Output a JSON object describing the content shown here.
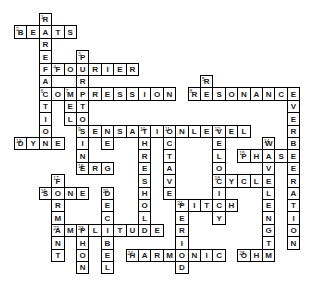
{
  "puzzle": {
    "type": "crossword",
    "title": "",
    "grid": {
      "cell_size": 19,
      "origin_x": 14,
      "origin_y": 14,
      "columns": 16,
      "rows": 15
    },
    "entries": [
      {
        "number": 1,
        "direction": "down",
        "answer": "RAREFACTION",
        "col": 2,
        "row": 0
      },
      {
        "number": 2,
        "direction": "across",
        "answer": "BEATS",
        "col": 0,
        "row": 1
      },
      {
        "number": 3,
        "direction": "down",
        "answer": "PURETONE",
        "col": 5,
        "row": 2
      },
      {
        "number": 4,
        "direction": "across",
        "answer": "FOURIER",
        "col": 3,
        "row": 3
      },
      {
        "number": 5,
        "direction": "down",
        "answer": "REVERBERATION",
        "col": 15,
        "row": 4
      },
      {
        "number": 6,
        "direction": "across",
        "answer": "COMPRESSION",
        "col": 2,
        "row": 5
      },
      {
        "number": 7,
        "direction": "down",
        "answer": "MEL",
        "col": 3,
        "row": 5
      },
      {
        "number": 8,
        "direction": "across",
        "answer": "RESONANCE",
        "col": 10,
        "row": 5
      },
      {
        "number": 9,
        "direction": "down",
        "answer": "SINE",
        "col": 4,
        "row": 8
      },
      {
        "number": 9,
        "direction": "across",
        "answer": "SENSATIONLEVEL",
        "col": 4,
        "row": 8
      },
      {
        "number": 10,
        "direction": "down",
        "answer": "THRESHOLD",
        "col": 7,
        "row": 8
      },
      {
        "number": 11,
        "direction": "down",
        "answer": "OCTAVE",
        "col": 9,
        "row": 8
      },
      {
        "number": 12,
        "direction": "down",
        "answer": "VELOCITY",
        "col": 11,
        "row": 8
      },
      {
        "number": 13,
        "direction": "across",
        "answer": "DYNE",
        "col": 0,
        "row": 9
      },
      {
        "number": 14,
        "direction": "down",
        "answer": "WAVELENGTH",
        "col": 13,
        "row": 9
      },
      {
        "number": 15,
        "direction": "across",
        "answer": "PHASE",
        "col": 12,
        "row": 10
      },
      {
        "number": 16,
        "direction": "across",
        "answer": "ERG",
        "col": 4,
        "row": 11
      },
      {
        "number": 17,
        "direction": "down",
        "answer": "FORMANT",
        "col": 2,
        "row": 12
      },
      {
        "number": 18,
        "direction": "across",
        "answer": "CYCLE",
        "col": 11,
        "row": 12
      },
      {
        "number": 19,
        "direction": "across",
        "answer": "SONE",
        "col": 1,
        "row": 13
      },
      {
        "number": 20,
        "direction": "down",
        "answer": "DECIBEL",
        "col": 5,
        "row": 13
      },
      {
        "number": 21,
        "direction": "down",
        "answer": "PERIOD",
        "col": 9,
        "row": 14
      },
      {
        "number": 21,
        "direction": "across",
        "answer": "PITCH",
        "col": 9,
        "row": 14
      },
      {
        "number": 22,
        "direction": "down",
        "answer": "PHON",
        "col": 4,
        "row": 16
      },
      {
        "number": 23,
        "direction": "across",
        "answer": "AMPLITUDE",
        "col": 2,
        "row": 16
      },
      {
        "number": 24,
        "direction": "across",
        "answer": "HARMONIC",
        "col": 6,
        "row": 18
      },
      {
        "number": 25,
        "direction": "across",
        "answer": "OHM",
        "col": 13,
        "row": 18
      }
    ],
    "cells": [
      {
        "c": 2,
        "r": 0,
        "l": "R",
        "n": "1"
      },
      {
        "c": 0,
        "r": 1,
        "l": "B",
        "n": "2"
      },
      {
        "c": 1,
        "r": 1,
        "l": "E",
        "n": ""
      },
      {
        "c": 2,
        "r": 1,
        "l": "A",
        "n": ""
      },
      {
        "c": 3,
        "r": 1,
        "l": "T",
        "n": ""
      },
      {
        "c": 4,
        "r": 1,
        "l": "S",
        "n": ""
      },
      {
        "c": 2,
        "r": 2,
        "l": "R",
        "n": ""
      },
      {
        "c": 2,
        "r": 3,
        "l": "E",
        "n": ""
      },
      {
        "c": 5,
        "r": 3,
        "l": "P",
        "n": "3"
      },
      {
        "c": 2,
        "r": 4,
        "l": "F",
        "n": ""
      },
      {
        "c": 3,
        "r": 4,
        "l": "F",
        "n": "4"
      },
      {
        "c": 4,
        "r": 4,
        "l": "O",
        "n": ""
      },
      {
        "c": 5,
        "r": 4,
        "l": "U",
        "n": ""
      },
      {
        "c": 6,
        "r": 4,
        "l": "R",
        "n": ""
      },
      {
        "c": 7,
        "r": 4,
        "l": "I",
        "n": ""
      },
      {
        "c": 8,
        "r": 4,
        "l": "E",
        "n": ""
      },
      {
        "c": 9,
        "r": 4,
        "l": "R",
        "n": ""
      },
      {
        "c": 2,
        "r": 5,
        "l": "A",
        "n": ""
      },
      {
        "c": 5,
        "r": 5,
        "l": "R",
        "n": ""
      },
      {
        "c": 15,
        "r": 5,
        "l": "R",
        "n": "5"
      },
      {
        "c": 2,
        "r": 6,
        "l": "C",
        "n": "6"
      },
      {
        "c": 3,
        "r": 6,
        "l": "O",
        "n": ""
      },
      {
        "c": 4,
        "r": 6,
        "l": "M",
        "n": "7"
      },
      {
        "c": 5,
        "r": 6,
        "l": "P",
        "n": ""
      },
      {
        "c": 6,
        "r": 6,
        "l": "R",
        "n": ""
      },
      {
        "c": 7,
        "r": 6,
        "l": "E",
        "n": ""
      },
      {
        "c": 8,
        "r": 6,
        "l": "S",
        "n": ""
      },
      {
        "c": 9,
        "r": 6,
        "l": "S",
        "n": ""
      },
      {
        "c": 10,
        "r": 6,
        "l": "I",
        "n": ""
      },
      {
        "c": 11,
        "r": 6,
        "l": "O",
        "n": ""
      },
      {
        "c": 12,
        "r": 6,
        "l": "N",
        "n": ""
      },
      {
        "c": 14,
        "r": 6,
        "l": "R",
        "n": "8"
      },
      {
        "c": 15,
        "r": 6,
        "l": "E",
        "n": ""
      },
      {
        "c": 16,
        "r": 6,
        "l": "S",
        "n": ""
      },
      {
        "c": 17,
        "r": 6,
        "l": "O",
        "n": ""
      },
      {
        "c": 18,
        "r": 6,
        "l": "N",
        "n": ""
      },
      {
        "c": 19,
        "r": 6,
        "l": "A",
        "n": ""
      },
      {
        "c": 20,
        "r": 6,
        "l": "N",
        "n": ""
      },
      {
        "c": 21,
        "r": 6,
        "l": "C",
        "n": ""
      },
      {
        "c": 22,
        "r": 6,
        "l": "E",
        "n": ""
      },
      {
        "c": 2,
        "r": 7,
        "l": "T",
        "n": ""
      },
      {
        "c": 4,
        "r": 7,
        "l": "E",
        "n": ""
      },
      {
        "c": 5,
        "r": 7,
        "l": "T",
        "n": ""
      },
      {
        "c": 22,
        "r": 7,
        "l": "V",
        "n": ""
      },
      {
        "c": 2,
        "r": 8,
        "l": "I",
        "n": ""
      },
      {
        "c": 4,
        "r": 8,
        "l": "L",
        "n": ""
      },
      {
        "c": 5,
        "r": 8,
        "l": "O",
        "n": ""
      },
      {
        "c": 22,
        "r": 8,
        "l": "E",
        "n": ""
      },
      {
        "c": 2,
        "r": 9,
        "l": "O",
        "n": ""
      },
      {
        "c": 5,
        "r": 9,
        "l": "S",
        "n": "9"
      },
      {
        "c": 6,
        "r": 9,
        "l": "E",
        "n": ""
      },
      {
        "c": 7,
        "r": 9,
        "l": "N",
        "n": ""
      },
      {
        "c": 8,
        "r": 9,
        "l": "S",
        "n": ""
      },
      {
        "c": 9,
        "r": 9,
        "l": "A",
        "n": ""
      },
      {
        "c": 10,
        "r": 9,
        "l": "T",
        "n": "10"
      },
      {
        "c": 11,
        "r": 9,
        "l": "I",
        "n": ""
      },
      {
        "c": 12,
        "r": 9,
        "l": "O",
        "n": "11"
      },
      {
        "c": 13,
        "r": 9,
        "l": "N",
        "n": ""
      },
      {
        "c": 14,
        "r": 9,
        "l": "L",
        "n": ""
      },
      {
        "c": 15,
        "r": 9,
        "l": "E",
        "n": ""
      },
      {
        "c": 16,
        "r": 9,
        "l": "V",
        "n": "12"
      },
      {
        "c": 17,
        "r": 9,
        "l": "E",
        "n": ""
      },
      {
        "c": 18,
        "r": 9,
        "l": "L",
        "n": ""
      },
      {
        "c": 22,
        "r": 9,
        "l": "R",
        "n": ""
      },
      {
        "c": 0,
        "r": 10,
        "l": "D",
        "n": "13"
      },
      {
        "c": 1,
        "r": 10,
        "l": "Y",
        "n": ""
      },
      {
        "c": 2,
        "r": 10,
        "l": "N",
        "n": ""
      },
      {
        "c": 3,
        "r": 10,
        "l": "E",
        "n": ""
      },
      {
        "c": 5,
        "r": 10,
        "l": "I",
        "n": ""
      },
      {
        "c": 7,
        "r": 10,
        "l": "E",
        "n": ""
      },
      {
        "c": 10,
        "r": 10,
        "l": "H",
        "n": ""
      },
      {
        "c": 12,
        "r": 10,
        "l": "C",
        "n": ""
      },
      {
        "c": 16,
        "r": 10,
        "l": "E",
        "n": ""
      },
      {
        "c": 20,
        "r": 10,
        "l": "W",
        "n": "14"
      },
      {
        "c": 22,
        "r": 10,
        "l": "B",
        "n": ""
      },
      {
        "c": 5,
        "r": 11,
        "l": "N",
        "n": ""
      },
      {
        "c": 10,
        "r": 11,
        "l": "R",
        "n": ""
      },
      {
        "c": 12,
        "r": 11,
        "l": "T",
        "n": ""
      },
      {
        "c": 16,
        "r": 11,
        "l": "L",
        "n": ""
      },
      {
        "c": 18,
        "r": 11,
        "l": "P",
        "n": "15"
      },
      {
        "c": 19,
        "r": 11,
        "l": "H",
        "n": ""
      },
      {
        "c": 20,
        "r": 11,
        "l": "A",
        "n": ""
      },
      {
        "c": 21,
        "r": 11,
        "l": "S",
        "n": ""
      },
      {
        "c": 22,
        "r": 11,
        "l": "E",
        "n": ""
      },
      {
        "c": 5,
        "r": 12,
        "l": "E",
        "n": "16"
      },
      {
        "c": 6,
        "r": 12,
        "l": "R",
        "n": ""
      },
      {
        "c": 7,
        "r": 12,
        "l": "G",
        "n": ""
      },
      {
        "c": 10,
        "r": 12,
        "l": "E",
        "n": ""
      },
      {
        "c": 12,
        "r": 12,
        "l": "A",
        "n": ""
      },
      {
        "c": 16,
        "r": 12,
        "l": "O",
        "n": ""
      },
      {
        "c": 20,
        "r": 12,
        "l": "V",
        "n": ""
      },
      {
        "c": 22,
        "r": 12,
        "l": "E",
        "n": ""
      },
      {
        "c": 3,
        "r": 13,
        "l": "F",
        "n": "17"
      },
      {
        "c": 10,
        "r": 13,
        "l": "S",
        "n": ""
      },
      {
        "c": 12,
        "r": 13,
        "l": "V",
        "n": ""
      },
      {
        "c": 16,
        "r": 13,
        "l": "C",
        "n": "18"
      },
      {
        "c": 17,
        "r": 13,
        "l": "Y",
        "n": ""
      },
      {
        "c": 18,
        "r": 13,
        "l": "C",
        "n": ""
      },
      {
        "c": 19,
        "r": 13,
        "l": "L",
        "n": ""
      },
      {
        "c": 20,
        "r": 13,
        "l": "E",
        "n": ""
      },
      {
        "c": 22,
        "r": 13,
        "l": "R",
        "n": ""
      },
      {
        "c": 2,
        "r": 14,
        "l": "S",
        "n": "19"
      },
      {
        "c": 3,
        "r": 14,
        "l": "O",
        "n": ""
      },
      {
        "c": 4,
        "r": 14,
        "l": "N",
        "n": ""
      },
      {
        "c": 5,
        "r": 14,
        "l": "E",
        "n": ""
      },
      {
        "c": 7,
        "r": 14,
        "l": "D",
        "n": "20"
      },
      {
        "c": 10,
        "r": 14,
        "l": "H",
        "n": ""
      },
      {
        "c": 12,
        "r": 14,
        "l": "E",
        "n": ""
      },
      {
        "c": 16,
        "r": 14,
        "l": "I",
        "n": ""
      },
      {
        "c": 20,
        "r": 14,
        "l": "L",
        "n": ""
      },
      {
        "c": 22,
        "r": 14,
        "l": "A",
        "n": ""
      },
      {
        "c": 3,
        "r": 15,
        "l": "R",
        "n": ""
      },
      {
        "c": 7,
        "r": 15,
        "l": "E",
        "n": ""
      },
      {
        "c": 10,
        "r": 15,
        "l": "O",
        "n": ""
      },
      {
        "c": 13,
        "r": 15,
        "l": "P",
        "n": "21"
      },
      {
        "c": 14,
        "r": 15,
        "l": "I",
        "n": ""
      },
      {
        "c": 15,
        "r": 15,
        "l": "T",
        "n": ""
      },
      {
        "c": 16,
        "r": 15,
        "l": "C",
        "n": ""
      },
      {
        "c": 17,
        "r": 15,
        "l": "H",
        "n": ""
      },
      {
        "c": 20,
        "r": 15,
        "l": "E",
        "n": ""
      },
      {
        "c": 22,
        "r": 15,
        "l": "T",
        "n": ""
      },
      {
        "c": 3,
        "r": 16,
        "l": "M",
        "n": ""
      },
      {
        "c": 7,
        "r": 16,
        "l": "C",
        "n": ""
      },
      {
        "c": 10,
        "r": 16,
        "l": "L",
        "n": ""
      },
      {
        "c": 13,
        "r": 16,
        "l": "E",
        "n": ""
      },
      {
        "c": 16,
        "r": 16,
        "l": "Y",
        "n": ""
      },
      {
        "c": 20,
        "r": 16,
        "l": "N",
        "n": ""
      },
      {
        "c": 22,
        "r": 16,
        "l": "I",
        "n": ""
      },
      {
        "c": 3,
        "r": 17,
        "l": "A",
        "n": "22"
      },
      {
        "c": 4,
        "r": 17,
        "l": "M",
        "n": ""
      },
      {
        "c": 5,
        "r": 17,
        "l": "P",
        "n": "23"
      },
      {
        "c": 6,
        "r": 17,
        "l": "L",
        "n": ""
      },
      {
        "c": 7,
        "r": 17,
        "l": "I",
        "n": ""
      },
      {
        "c": 8,
        "r": 17,
        "l": "T",
        "n": ""
      },
      {
        "c": 9,
        "r": 17,
        "l": "U",
        "n": ""
      },
      {
        "c": 10,
        "r": 17,
        "l": "D",
        "n": ""
      },
      {
        "c": 11,
        "r": 17,
        "l": "E",
        "n": ""
      },
      {
        "c": 13,
        "r": 17,
        "l": "R",
        "n": ""
      },
      {
        "c": 20,
        "r": 17,
        "l": "G",
        "n": ""
      },
      {
        "c": 22,
        "r": 17,
        "l": "O",
        "n": ""
      },
      {
        "c": 3,
        "r": 18,
        "l": "N",
        "n": ""
      },
      {
        "c": 5,
        "r": 18,
        "l": "H",
        "n": ""
      },
      {
        "c": 7,
        "r": 18,
        "l": "B",
        "n": ""
      },
      {
        "c": 13,
        "r": 18,
        "l": "I",
        "n": ""
      },
      {
        "c": 20,
        "r": 18,
        "l": "T",
        "n": ""
      },
      {
        "c": 22,
        "r": 18,
        "l": "N",
        "n": ""
      },
      {
        "c": 3,
        "r": 19,
        "l": "T",
        "n": ""
      },
      {
        "c": 5,
        "r": 19,
        "l": "O",
        "n": ""
      },
      {
        "c": 7,
        "r": 19,
        "l": "E",
        "n": ""
      },
      {
        "c": 9,
        "r": 19,
        "l": "H",
        "n": "24"
      },
      {
        "c": 10,
        "r": 19,
        "l": "A",
        "n": ""
      },
      {
        "c": 11,
        "r": 19,
        "l": "R",
        "n": ""
      },
      {
        "c": 12,
        "r": 19,
        "l": "M",
        "n": ""
      },
      {
        "c": 13,
        "r": 19,
        "l": "O",
        "n": ""
      },
      {
        "c": 14,
        "r": 19,
        "l": "N",
        "n": ""
      },
      {
        "c": 15,
        "r": 19,
        "l": "I",
        "n": ""
      },
      {
        "c": 16,
        "r": 19,
        "l": "C",
        "n": ""
      },
      {
        "c": 18,
        "r": 19,
        "l": "O",
        "n": "25"
      },
      {
        "c": 19,
        "r": 19,
        "l": "H",
        "n": ""
      },
      {
        "c": 20,
        "r": 19,
        "l": "M",
        "n": ""
      },
      {
        "c": 5,
        "r": 20,
        "l": "N",
        "n": ""
      },
      {
        "c": 7,
        "r": 20,
        "l": "L",
        "n": ""
      },
      {
        "c": 13,
        "r": 20,
        "l": "D",
        "n": ""
      }
    ]
  }
}
